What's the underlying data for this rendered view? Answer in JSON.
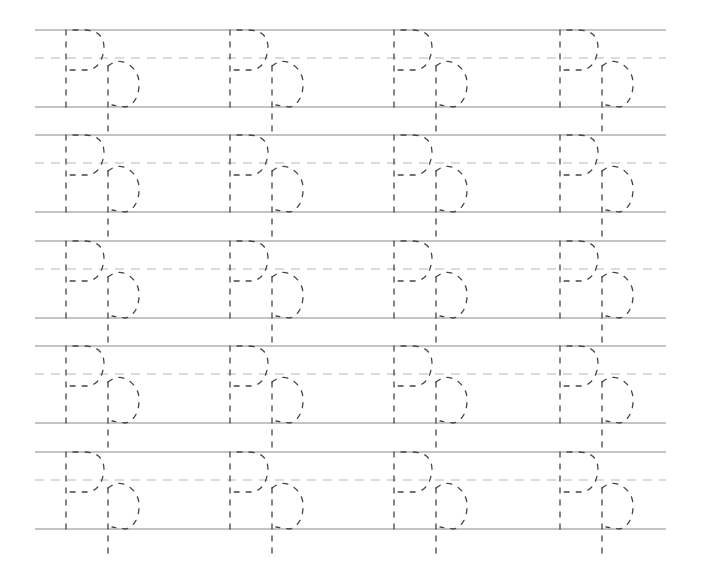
{
  "worksheet": {
    "letter_upper": "P",
    "letter_lower": "p",
    "rows": 5,
    "letters_per_row": 4,
    "line_left_x": 35,
    "line_right_x": 666,
    "row_top_y": [
      30,
      135,
      241,
      346,
      452
    ],
    "row_height": 77,
    "midline_offset": 28,
    "letter_x": [
      66,
      230,
      394,
      560
    ],
    "colors": {
      "solid_line": "#b0b0b0",
      "dashed_line": "#b8b8b8",
      "trace": "#444444",
      "background": "#ffffff"
    }
  }
}
